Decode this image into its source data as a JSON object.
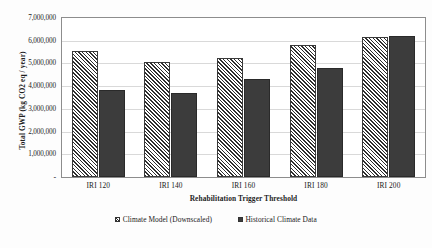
{
  "chart_data": {
    "type": "bar",
    "title": "",
    "xlabel": "Rehabilitation Trigger Threshold",
    "ylabel": "Total GWP (kg CO2 eq / year)",
    "categories": [
      "IRI 120",
      "IRI 140",
      "IRI 160",
      "IRI 180",
      "IRI 200"
    ],
    "series": [
      {
        "name": "Climate Model (Downscaled)",
        "pattern": "diagonal-hatch",
        "color": "#2e2e2e",
        "values": [
          5560000,
          5070000,
          5260000,
          5800000,
          6150000
        ]
      },
      {
        "name": "Historical Climate Data",
        "pattern": "solid",
        "color": "#3c3c3c",
        "values": [
          3850000,
          3700000,
          4300000,
          4780000,
          6210000
        ]
      }
    ],
    "ylim": [
      0,
      7000000
    ],
    "ytick_values": [
      0,
      1000000,
      2000000,
      3000000,
      4000000,
      5000000,
      6000000,
      7000000
    ],
    "ytick_labels": [
      "-",
      "1,000,000",
      "2,000,000",
      "3,000,000",
      "4,000,000",
      "5,000,000",
      "6,000,000",
      "7,000,000"
    ],
    "grid": true,
    "grid_axis": "y",
    "legend_position": "bottom"
  },
  "legend": {
    "items": [
      {
        "label": "Climate Model (Downscaled)",
        "swatch": "hatched-swatch-icon"
      },
      {
        "label": "Historical Climate Data",
        "swatch": "solid-swatch-icon"
      }
    ]
  }
}
